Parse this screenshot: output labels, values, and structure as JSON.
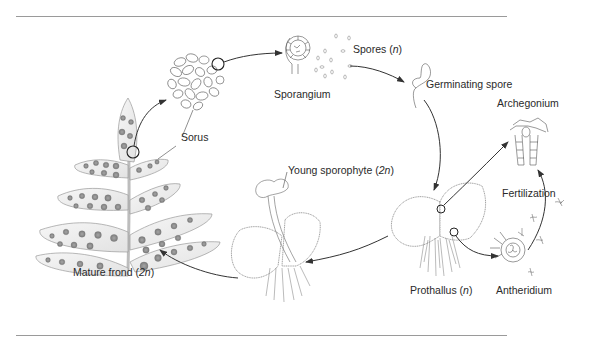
{
  "diagram": {
    "type": "life-cycle",
    "colors": {
      "line": "#7a7a7a",
      "arrow": "#333333",
      "frond_fill": "#eaeaea",
      "sorus_fill": "#8e8e8e",
      "rule": "#9a9a9a"
    },
    "labels": {
      "sorus": "Sorus",
      "sporangium": "Sporangium",
      "spores": "Spores (",
      "spores_n": "n",
      "spores_close": ")",
      "germinating_spore": "Germinating spore",
      "archegonium": "Archegonium",
      "fertilization": "Fertilization",
      "antheridium": "Antheridium",
      "prothallus": "Prothallus (",
      "prothallus_n": "n",
      "prothallus_close": ")",
      "young_sporophyte": "Young sporophyte (",
      "young_sporophyte_2n": "2n",
      "young_sporophyte_close": ")",
      "mature_frond": "Mature frond (",
      "mature_frond_2n": "2n",
      "mature_frond_close": ")"
    },
    "stages": [
      {
        "id": "mature-frond",
        "label": "Mature frond (2n)",
        "ploidy": "2n"
      },
      {
        "id": "sorus",
        "label": "Sorus"
      },
      {
        "id": "sporangium",
        "label": "Sporangium"
      },
      {
        "id": "spores",
        "label": "Spores (n)",
        "ploidy": "n"
      },
      {
        "id": "germinating-spore",
        "label": "Germinating spore"
      },
      {
        "id": "prothallus",
        "label": "Prothallus (n)",
        "ploidy": "n"
      },
      {
        "id": "archegonium",
        "label": "Archegonium"
      },
      {
        "id": "antheridium",
        "label": "Antheridium"
      },
      {
        "id": "fertilization",
        "label": "Fertilization"
      },
      {
        "id": "young-sporophyte",
        "label": "Young sporophyte (2n)",
        "ploidy": "2n"
      }
    ],
    "edges": [
      {
        "from": "mature-frond",
        "to": "sorus"
      },
      {
        "from": "sorus",
        "to": "sporangium"
      },
      {
        "from": "sporangium",
        "to": "spores"
      },
      {
        "from": "spores",
        "to": "germinating-spore"
      },
      {
        "from": "germinating-spore",
        "to": "prothallus"
      },
      {
        "from": "prothallus",
        "to": "archegonium"
      },
      {
        "from": "prothallus",
        "to": "antheridium"
      },
      {
        "from": "antheridium",
        "to": "archegonium",
        "label": "Fertilization"
      },
      {
        "from": "prothallus",
        "to": "young-sporophyte"
      },
      {
        "from": "young-sporophyte",
        "to": "mature-frond"
      }
    ]
  }
}
